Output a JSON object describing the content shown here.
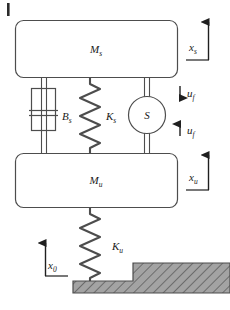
{
  "figure": {
    "title_mark": "|",
    "background_color": "#ffffff",
    "line_color": "#4d4d4d",
    "hatch_color": "#808080",
    "text_color": "#1a1a1a"
  },
  "bodies": [
    {
      "id": "sprung-mass",
      "symbol": "M",
      "subscript": "s",
      "shape": "rounded-rectangle"
    },
    {
      "id": "unsprung-mass",
      "symbol": "M",
      "subscript": "u",
      "shape": "rounded-rectangle"
    }
  ],
  "elements": [
    {
      "id": "damper",
      "symbol": "B",
      "subscript": "s",
      "kind": "damper"
    },
    {
      "id": "suspension-spring",
      "symbol": "K",
      "subscript": "s",
      "kind": "spring"
    },
    {
      "id": "actuator",
      "symbol": "S",
      "subscript": "",
      "kind": "circle"
    },
    {
      "id": "tire-spring",
      "symbol": "K",
      "subscript": "u",
      "kind": "spring"
    }
  ],
  "displacements": [
    {
      "id": "x-sprung",
      "symbol": "x",
      "subscript": "s",
      "direction": "up"
    },
    {
      "id": "x-unsprung",
      "symbol": "x",
      "subscript": "u",
      "direction": "up"
    },
    {
      "id": "x-road",
      "symbol": "x",
      "subscript": "0",
      "direction": "up"
    }
  ],
  "forces": [
    {
      "id": "actuator-force-down",
      "symbol": "u",
      "subscript": "f",
      "direction": "down"
    },
    {
      "id": "actuator-force-up",
      "symbol": "u",
      "subscript": "f",
      "direction": "up"
    }
  ],
  "ground": {
    "id": "road-profile",
    "fill_pattern": "diagonal-hatch",
    "fill_color": "#9a9a9a"
  }
}
